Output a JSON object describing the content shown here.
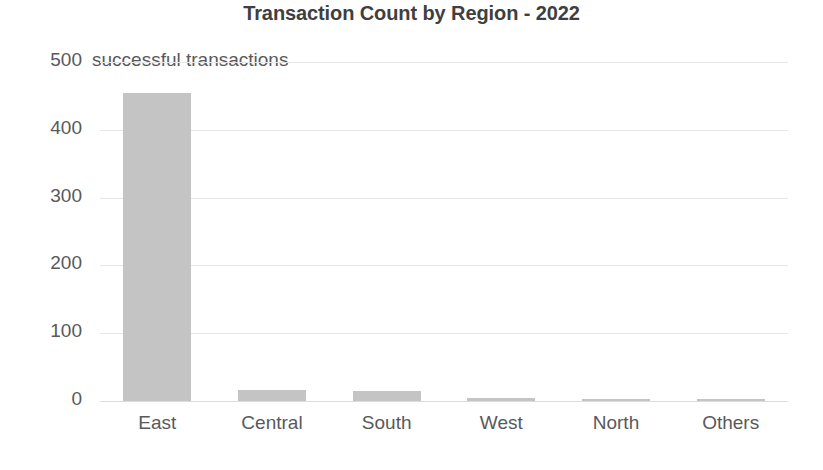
{
  "chart_data": {
    "type": "bar",
    "title": "Transaction Count by Region - 2022",
    "subtitle": "",
    "xlabel": "",
    "ylabel": "",
    "axis_annotation": "successful transactions",
    "categories": [
      "East",
      "Central",
      "South",
      "West",
      "North",
      "Others"
    ],
    "values": [
      454,
      16,
      15,
      5,
      3,
      2
    ],
    "series": [
      {
        "name": "Transaction Count",
        "values": [
          454,
          16,
          15,
          5,
          3,
          2
        ]
      }
    ],
    "ylim": [
      0,
      500
    ],
    "ytick_labels": [
      "0",
      "100",
      "200",
      "300",
      "400",
      "500"
    ],
    "ytick_values": [
      0,
      100,
      200,
      300,
      400,
      500
    ],
    "grid": true,
    "grid_axis": "y",
    "legend": false,
    "legend_position": "none",
    "bar_color": "#c4c4c4",
    "grid_color": "#e6e6e6",
    "title_color": "#3f3f3f",
    "tick_label_color": "#58595b",
    "background_color": "#ffffff"
  }
}
